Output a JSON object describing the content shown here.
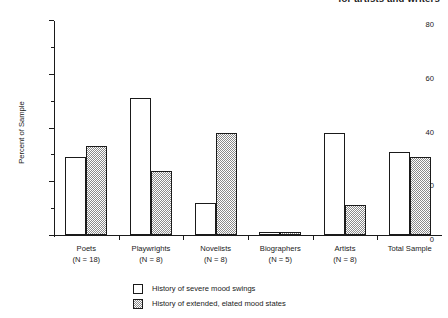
{
  "header": {
    "clipped_text": "for artists and writers"
  },
  "legend": {
    "position": "bottom-center",
    "entries": [
      {
        "label": "History of severe mood swings",
        "swatch": "open",
        "color": "#ffffff"
      },
      {
        "label": "History of extended, elated mood states",
        "swatch": "hatched",
        "color": "#8a8a8a"
      }
    ]
  },
  "chart_data": {
    "type": "bar",
    "title": "",
    "xlabel": "",
    "ylabel": "Percent of Sample",
    "ylim": [
      0,
      80
    ],
    "yticks": [
      0,
      20,
      40,
      60,
      80
    ],
    "yticks_minor": [
      10,
      30,
      50,
      70
    ],
    "ytick_labels": [
      "0",
      "20",
      "40",
      "60",
      "80"
    ],
    "grid": false,
    "categories": [
      "Poets",
      "Playwrights",
      "Novelists",
      "Biographers",
      "Artists",
      "Total Sample"
    ],
    "category_sublabels": [
      "(N = 18)",
      "(N = 8)",
      "(N = 8)",
      "(N = 5)",
      "(N = 8)",
      ""
    ],
    "series": [
      {
        "name": "History of severe mood swings",
        "values": [
          29,
          51,
          12,
          1,
          38,
          31
        ]
      },
      {
        "name": "History of extended, elated mood states",
        "values": [
          33,
          24,
          38,
          1,
          11,
          29
        ]
      }
    ]
  }
}
